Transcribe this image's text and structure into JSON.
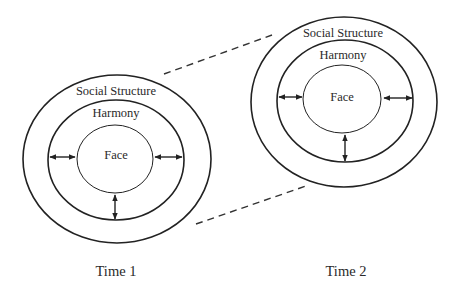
{
  "diagram": {
    "type": "concentric-circles-comparison",
    "colors": {
      "stroke": "#222222",
      "text": "#2a2a2a",
      "background": "#ffffff"
    },
    "panels": [
      {
        "caption": "Time 1",
        "rings": {
          "outer": "Social Structure",
          "middle": "Harmony",
          "inner": "Face"
        },
        "arrows": [
          "left-bidirectional",
          "right-bidirectional",
          "bottom-bidirectional"
        ]
      },
      {
        "caption": "Time 2",
        "rings": {
          "outer": "Social Structure",
          "middle": "Harmony",
          "inner": "Face"
        },
        "arrows": [
          "left-bidirectional",
          "right-bidirectional",
          "bottom-bidirectional"
        ]
      }
    ],
    "connectors": [
      "dashed-upper",
      "dashed-lower"
    ]
  }
}
